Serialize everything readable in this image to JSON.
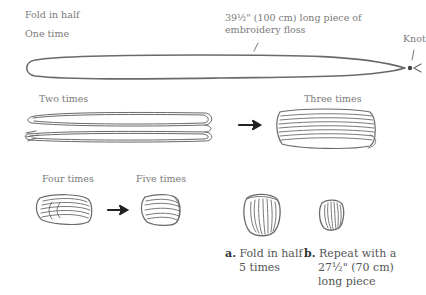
{
  "labels": {
    "fold_in_half": "Fold in half",
    "one_time": "One time",
    "floss_note_line1": "39½\" (100 cm) long piece of",
    "floss_note_line2": "embroidery floss",
    "knot": "Knot",
    "two_times": "Two times",
    "three_times": "Three times",
    "four_times": "Four times",
    "five_times": "Five times"
  },
  "captions": {
    "a": {
      "letter": "a.",
      "line1": "Fold in half",
      "line2": "5 times"
    },
    "b": {
      "letter": "b.",
      "line1": "Repeat with a",
      "line2": "27½\" (70 cm)",
      "line3": "long piece"
    }
  },
  "colors": {
    "background": "#ffffff",
    "stroke": "#555555",
    "text": "#7a7a7a"
  }
}
